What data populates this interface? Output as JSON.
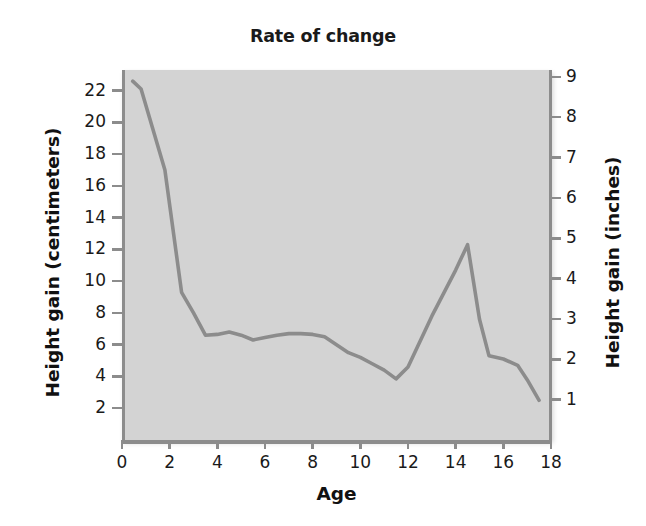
{
  "chart_data": {
    "type": "line",
    "title": "Rate of change",
    "xlabel": "Age",
    "ylabel": "Height gain (centimeters)",
    "ylabel_secondary": "Height gain (inches)",
    "xlim": [
      0,
      18
    ],
    "ylim": [
      0,
      23.3
    ],
    "ylim_secondary": [
      0,
      9.17
    ],
    "grid": false,
    "legend": null,
    "xticks": [
      0,
      2,
      4,
      6,
      8,
      10,
      12,
      14,
      16,
      18
    ],
    "xtick_labels": [
      "0",
      "2",
      "4",
      "6",
      "8",
      "10",
      "12",
      "14",
      "16",
      "18"
    ],
    "yticks": [
      2,
      4,
      6,
      8,
      10,
      12,
      14,
      16,
      18,
      20,
      22
    ],
    "ytick_labels": [
      "2",
      "4",
      "6",
      "8",
      "10",
      "12",
      "14",
      "16",
      "18",
      "20",
      "22"
    ],
    "yticks_secondary": [
      1,
      2,
      3,
      4,
      5,
      6,
      7,
      8,
      9
    ],
    "ytick_labels_secondary": [
      "1",
      "2",
      "3",
      "4",
      "5",
      "6",
      "7",
      "8",
      "9"
    ],
    "line_color": "#8c8c8c",
    "plot_background": "#d3d3d3",
    "page_background": "#ffffff",
    "series": [
      {
        "name": "Height gain",
        "x": [
          0.45,
          0.8,
          1.8,
          2.5,
          3.0,
          3.5,
          4.0,
          4.5,
          5.0,
          5.5,
          6.0,
          6.5,
          7.0,
          7.5,
          8.0,
          8.5,
          9.0,
          9.5,
          10.0,
          10.5,
          11.0,
          11.5,
          12.0,
          13.0,
          14.0,
          14.5,
          15.0,
          15.4,
          16.0,
          16.6,
          17.0,
          17.5
        ],
        "y": [
          22.6,
          22.1,
          17.0,
          9.3,
          8.0,
          6.6,
          6.65,
          6.8,
          6.6,
          6.3,
          6.45,
          6.6,
          6.7,
          6.7,
          6.65,
          6.5,
          6.0,
          5.5,
          5.2,
          4.8,
          4.4,
          3.85,
          4.6,
          7.8,
          10.7,
          12.3,
          7.6,
          5.3,
          5.1,
          4.7,
          3.8,
          2.5
        ]
      }
    ]
  }
}
